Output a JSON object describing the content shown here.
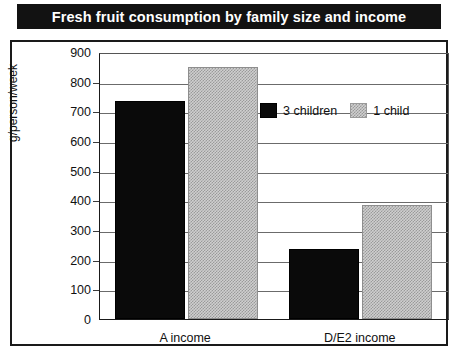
{
  "title": "Fresh fruit consumption by family size and income",
  "chart_data": {
    "type": "bar",
    "title": "Fresh fruit consumption by family size and income",
    "xlabel": "",
    "ylabel": "g/person/week",
    "categories": [
      "A income",
      "D/E2 income"
    ],
    "series": [
      {
        "name": "3 children",
        "values": [
          735,
          235
        ],
        "color": "#0a0a0a"
      },
      {
        "name": "1 child",
        "values": [
          850,
          385
        ],
        "color": "#c4c4c4"
      }
    ],
    "ylim": [
      0,
      900
    ],
    "yticks": [
      0,
      100,
      200,
      300,
      400,
      500,
      600,
      700,
      800,
      900
    ],
    "ytick_labels": [
      "0",
      "100",
      "200",
      "300",
      "400",
      "500",
      "600",
      "700",
      "800",
      "900"
    ],
    "grid": true,
    "legend_position": "top-right"
  },
  "legend": {
    "entries": [
      {
        "label": "3 children",
        "swatch": "black-swatch"
      },
      {
        "label": "1 child",
        "swatch": "gray-swatch"
      }
    ]
  },
  "colors": {
    "title_bar_background": "#121212",
    "title_text": "#ffffff",
    "series_3_children": "#0a0a0a",
    "series_1_child": "#c4c4c4",
    "frame_border": "#1a1a1a",
    "gridline": "#6b6b6b",
    "plot_background": "#ffffff"
  }
}
